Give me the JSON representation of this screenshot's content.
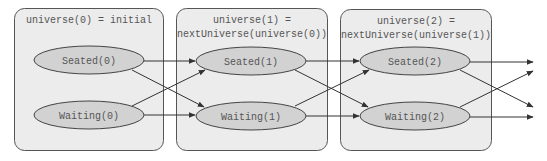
{
  "diagram": {
    "generations": [
      {
        "header_line1": "universe(0) = initial",
        "header_line2": "",
        "nodes": {
          "seated": "Seated(0)",
          "waiting": "Waiting(0)"
        }
      },
      {
        "header_line1": "universe(1) =",
        "header_line2": "nextUniverse(universe(0))",
        "nodes": {
          "seated": "Seated(1)",
          "waiting": "Waiting(1)"
        }
      },
      {
        "header_line1": "universe(2) =",
        "header_line2": "nextUniverse(universe(1))",
        "nodes": {
          "seated": "Seated(2)",
          "waiting": "Waiting(2)"
        }
      }
    ],
    "edges": [
      {
        "from": "Seated(0)",
        "to": "Seated(1)"
      },
      {
        "from": "Seated(0)",
        "to": "Waiting(1)"
      },
      {
        "from": "Waiting(0)",
        "to": "Seated(1)"
      },
      {
        "from": "Waiting(0)",
        "to": "Waiting(1)"
      },
      {
        "from": "Seated(1)",
        "to": "Seated(2)"
      },
      {
        "from": "Seated(1)",
        "to": "Waiting(2)"
      },
      {
        "from": "Waiting(1)",
        "to": "Seated(2)"
      },
      {
        "from": "Waiting(1)",
        "to": "Waiting(2)"
      },
      {
        "from": "Seated(2)",
        "to": "next-seated"
      },
      {
        "from": "Seated(2)",
        "to": "next-waiting"
      },
      {
        "from": "Waiting(2)",
        "to": "next-seated"
      },
      {
        "from": "Waiting(2)",
        "to": "next-waiting"
      }
    ],
    "colors": {
      "box_fill": "#ececec",
      "node_fill": "#d2d2d2",
      "stroke": "#444444",
      "text": "#555555"
    }
  }
}
